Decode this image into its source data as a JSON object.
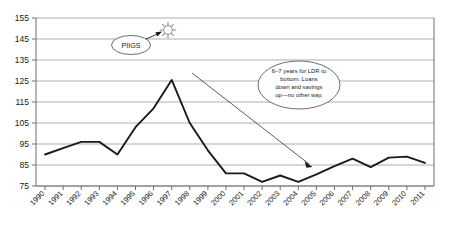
{
  "chart_data": {
    "type": "line",
    "title": "",
    "subtitle": "",
    "xlabel": "",
    "ylabel": "",
    "grid": true,
    "legend": "none",
    "xlim": [
      "1990",
      "2011"
    ],
    "ylim": [
      75,
      155
    ],
    "yticks": [
      75,
      85,
      95,
      105,
      115,
      125,
      135,
      145,
      155
    ],
    "categories": [
      "1990",
      "1991",
      "1992",
      "1993",
      "1994",
      "1995",
      "1996",
      "1997",
      "1998",
      "1999",
      "2000",
      "2001",
      "2002",
      "2003",
      "2004",
      "2005",
      "2006",
      "2007",
      "2008",
      "2009",
      "2010",
      "2011"
    ],
    "series": [
      {
        "name": "LDR",
        "values": [
          90.0,
          93.0,
          96.0,
          96.0,
          90.0,
          103.0,
          112.0,
          125.5,
          105.0,
          92.0,
          81.0,
          81.0,
          77.0,
          80.0,
          77.0,
          80.5,
          84.5,
          88.0,
          84.0,
          88.5,
          89.0,
          86.0
        ]
      }
    ],
    "annotations": [
      {
        "name": "piigs-callout",
        "text": "PIIGS",
        "shape": "ellipse",
        "points_to": "sunburst-icon"
      },
      {
        "name": "ldr-bottom-callout",
        "text": "6–7 years for LDR to bottom. Loans down and savings up—no other way.",
        "lines": [
          "6–7 years for LDR to",
          "bottom. Loans",
          "down and savings",
          "up—no other way."
        ],
        "shape": "ellipse",
        "points_to": "2005"
      }
    ],
    "icons": [
      {
        "name": "sunburst-icon",
        "at_year": "1996",
        "at_value": 146
      }
    ],
    "colors": {
      "line": "#1a1a1a",
      "grid": "#9a9a9a",
      "axis": "#6e6e6e",
      "annotation_stroke": "#4a4a4a",
      "background": "#ffffff"
    }
  }
}
